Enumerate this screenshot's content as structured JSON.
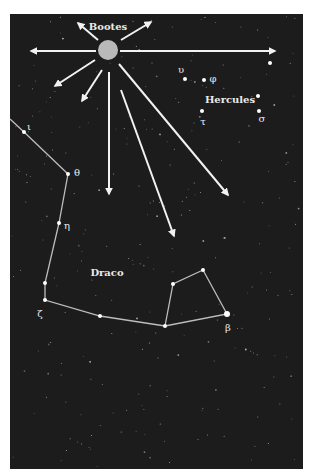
{
  "figure": {
    "background_color": "#1c1c1c",
    "panel": {
      "x": 10,
      "y": 14,
      "width": 293,
      "height": 455
    },
    "radiant": {
      "name": "Bootes",
      "center": [
        108,
        50
      ],
      "radius": 10,
      "fill": "#b9b9b9",
      "label": "Bootes",
      "label_pos": [
        108,
        30
      ]
    },
    "arrows": [
      {
        "from": [
          96,
          51
        ],
        "to": [
          31,
          51
        ]
      },
      {
        "from": [
          120,
          51
        ],
        "to": [
          275,
          51
        ]
      },
      {
        "from": [
          98,
          40
        ],
        "to": [
          78,
          23
        ]
      },
      {
        "from": [
          121,
          40
        ],
        "to": [
          151,
          22
        ]
      },
      {
        "from": [
          95,
          60
        ],
        "to": [
          55,
          86
        ]
      },
      {
        "from": [
          102,
          70
        ],
        "to": [
          82,
          101
        ]
      },
      {
        "from": [
          109,
          72
        ],
        "to": [
          109,
          194
        ]
      },
      {
        "from": [
          121,
          90
        ],
        "to": [
          174,
          236
        ]
      },
      {
        "from": [
          119,
          64
        ],
        "to": [
          228,
          195
        ]
      }
    ],
    "constellations": [
      {
        "name": "Hercules",
        "label": "Hercules",
        "label_pos": [
          230,
          103
        ],
        "stars": [
          {
            "pos": [
              185,
              79
            ],
            "greek": "υ",
            "label_pos": [
              181,
              73
            ]
          },
          {
            "pos": [
              204,
              80
            ],
            "greek": "φ",
            "label_pos": [
              213,
              82
            ]
          },
          {
            "pos": [
              202,
              111
            ],
            "greek": "τ",
            "label_pos": [
              203,
              125
            ]
          },
          {
            "pos": [
              258,
              96
            ],
            "greek": "",
            "label_pos": [
              0,
              0
            ]
          },
          {
            "pos": [
              259,
              111
            ],
            "greek": "σ",
            "label_pos": [
              262,
              122
            ]
          },
          {
            "pos": [
              270,
              63
            ],
            "greek": "",
            "label_pos": [
              0,
              0
            ]
          }
        ]
      },
      {
        "name": "Draco",
        "label": "Draco",
        "label_pos": [
          107,
          276
        ],
        "line_path": [
          [
            10,
            119
          ],
          [
            24,
            132
          ],
          [
            68,
            174
          ],
          [
            59,
            223
          ],
          [
            45,
            283
          ],
          [
            45,
            300
          ],
          [
            100,
            316
          ],
          [
            165,
            326
          ],
          [
            227,
            314
          ],
          [
            203,
            270
          ],
          [
            173,
            284
          ],
          [
            165,
            326
          ]
        ],
        "stars": [
          {
            "pos": [
              24,
              132
            ],
            "greek": "ι",
            "label_pos": [
              29,
              130
            ]
          },
          {
            "pos": [
              68,
              174
            ],
            "greek": "θ",
            "label_pos": [
              77,
              176
            ]
          },
          {
            "pos": [
              59,
              223
            ],
            "greek": "η",
            "label_pos": [
              67,
              229
            ]
          },
          {
            "pos": [
              45,
              283
            ],
            "greek": "",
            "label_pos": [
              0,
              0
            ]
          },
          {
            "pos": [
              45,
              300
            ],
            "greek": "ζ",
            "label_pos": [
              40,
              317
            ]
          },
          {
            "pos": [
              100,
              316
            ],
            "greek": "",
            "label_pos": [
              0,
              0
            ]
          },
          {
            "pos": [
              165,
              326
            ],
            "greek": "",
            "label_pos": [
              0,
              0
            ]
          },
          {
            "pos": [
              173,
              284
            ],
            "greek": "",
            "label_pos": [
              0,
              0
            ]
          },
          {
            "pos": [
              203,
              270
            ],
            "greek": "",
            "label_pos": [
              0,
              0
            ]
          },
          {
            "pos": [
              227,
              314
            ],
            "greek": "β",
            "label_pos": [
              228,
              331
            ],
            "bright": true
          }
        ]
      }
    ]
  }
}
